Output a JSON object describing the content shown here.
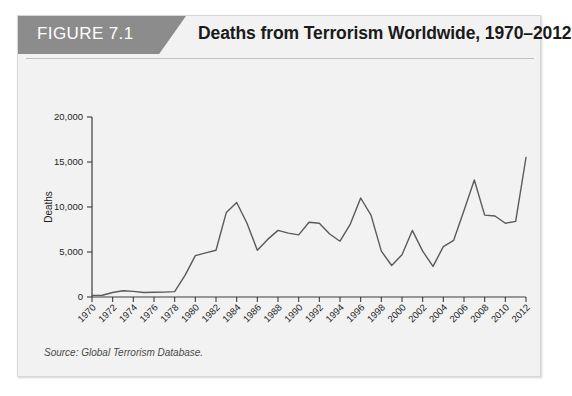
{
  "figure": {
    "tag": "FIGURE 7.1",
    "title": "Deaths from Terrorism Worldwide, 1970–2012",
    "source": "Source: Global Terrorism Database."
  },
  "chart_data": {
    "type": "line",
    "title": "Deaths from Terrorism Worldwide, 1970–2012",
    "xlabel": "Years",
    "ylabel": "Deaths",
    "xlim": [
      1970,
      2012
    ],
    "ylim": [
      0,
      20000
    ],
    "yticks": [
      0,
      5000,
      10000,
      15000,
      20000
    ],
    "ytick_labels": [
      "0",
      "5,000",
      "10,000",
      "15,000",
      "20,000"
    ],
    "xticks": [
      1970,
      1972,
      1974,
      1976,
      1978,
      1980,
      1982,
      1984,
      1986,
      1988,
      1990,
      1992,
      1994,
      1996,
      1998,
      2000,
      2002,
      2004,
      2006,
      2008,
      2010,
      2012
    ],
    "xtick_labels": [
      "1970",
      "1972",
      "1974",
      "1976",
      "1978",
      "1980",
      "1982",
      "1984",
      "1986",
      "1988",
      "1990",
      "1992",
      "1994",
      "1996",
      "1998",
      "2000",
      "2002",
      "2004",
      "2006",
      "2008",
      "2010",
      "2012"
    ],
    "grid": false,
    "legend": false,
    "series": [
      {
        "name": "Deaths from terrorism",
        "x": [
          1970,
          1971,
          1972,
          1973,
          1974,
          1975,
          1976,
          1977,
          1978,
          1979,
          1980,
          1981,
          1982,
          1983,
          1984,
          1985,
          1986,
          1987,
          1988,
          1989,
          1990,
          1991,
          1992,
          1993,
          1994,
          1995,
          1996,
          1997,
          1998,
          1999,
          2000,
          2001,
          2002,
          2003,
          2004,
          2005,
          2006,
          2007,
          2008,
          2009,
          2010,
          2011,
          2012
        ],
        "values": [
          180,
          200,
          500,
          700,
          620,
          500,
          520,
          540,
          600,
          2400,
          4600,
          4900,
          5200,
          9400,
          10500,
          8200,
          5200,
          6400,
          7400,
          7100,
          6900,
          8300,
          8200,
          7000,
          6200,
          8100,
          11000,
          9100,
          5100,
          3500,
          4700,
          7400,
          5100,
          3400,
          5600,
          6300,
          9600,
          13000,
          9100,
          9000,
          8200,
          8400,
          15500
        ]
      }
    ]
  }
}
